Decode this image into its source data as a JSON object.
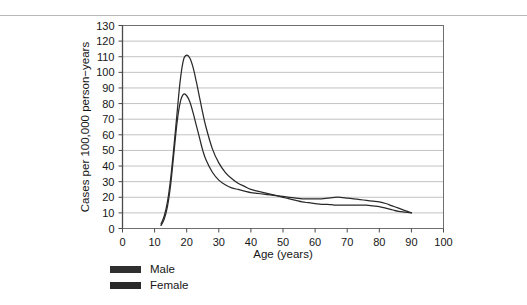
{
  "figure": {
    "background_color": "#ffffff",
    "rule_color": "#b9b9b9"
  },
  "chart_data": {
    "type": "line",
    "title": "",
    "subtitle": "",
    "xlabel": "Age (years)",
    "ylabel": "Cases per 100,000 person−years",
    "xlim": [
      0,
      100
    ],
    "ylim": [
      0,
      130
    ],
    "xticks": [
      0,
      10,
      20,
      30,
      40,
      50,
      60,
      70,
      80,
      90,
      100
    ],
    "yticks": [
      0,
      10,
      20,
      30,
      40,
      50,
      60,
      70,
      80,
      90,
      100,
      110,
      120,
      130
    ],
    "xtick_labels": [
      "0",
      "10",
      "20",
      "30",
      "40",
      "50",
      "60",
      "70",
      "80",
      "90",
      "100"
    ],
    "ytick_labels": [
      "0",
      "10",
      "20",
      "30",
      "40",
      "50",
      "60",
      "70",
      "80",
      "90",
      "100",
      "110",
      "120",
      "130"
    ],
    "grid": "horizontal",
    "grid_color": "#a8a8a8",
    "legend_position": "below-left",
    "series": [
      {
        "name": "Male",
        "color": "#2a2a2a",
        "x": [
          12,
          13,
          14,
          15,
          16,
          17,
          18,
          19,
          20,
          21,
          22,
          23,
          24,
          25,
          26,
          28,
          30,
          32,
          34,
          36,
          38,
          40,
          42,
          44,
          46,
          48,
          50,
          52,
          54,
          56,
          58,
          60,
          62,
          64,
          66,
          68,
          70,
          72,
          74,
          76,
          78,
          80,
          82,
          84,
          86,
          88,
          90
        ],
        "y": [
          3,
          8,
          17,
          32,
          52,
          74,
          95,
          108,
          111,
          109,
          103,
          94,
          84,
          74,
          65,
          51,
          42,
          36,
          32,
          29,
          27,
          25,
          24,
          23,
          22,
          21,
          20,
          19,
          18,
          17,
          16.5,
          16,
          15.5,
          15.5,
          15,
          15,
          15,
          15,
          15,
          15,
          14.5,
          14,
          13,
          12,
          11,
          10.5,
          10
        ]
      },
      {
        "name": "Female",
        "color": "#2a2a2a",
        "x": [
          12,
          13,
          14,
          15,
          16,
          17,
          18,
          19,
          20,
          21,
          22,
          23,
          24,
          25,
          26,
          28,
          30,
          32,
          34,
          36,
          38,
          40,
          42,
          44,
          46,
          48,
          50,
          52,
          54,
          56,
          58,
          60,
          62,
          64,
          66,
          68,
          70,
          72,
          74,
          76,
          78,
          80,
          82,
          84,
          86,
          88,
          90
        ],
        "y": [
          2,
          6,
          14,
          28,
          48,
          68,
          81,
          86,
          85,
          81,
          74,
          66,
          58,
          50,
          44,
          36,
          31,
          28,
          26,
          25,
          24,
          23,
          22.5,
          22,
          21.5,
          21,
          20.5,
          20,
          19.5,
          19,
          19,
          19,
          19,
          19.5,
          20,
          20,
          19.5,
          19,
          18.5,
          18,
          17.5,
          17,
          16,
          14.5,
          13,
          11.5,
          10
        ]
      }
    ],
    "annotations": {
      "male_peak": {
        "age": 20,
        "value": 111
      },
      "female_peak": {
        "age": 19,
        "value": 86
      },
      "crossover_age": 49
    }
  },
  "legend": {
    "items": [
      {
        "label": "Male",
        "color": "#2f2f2f"
      },
      {
        "label": "Female",
        "color": "#2a2a2a"
      }
    ]
  }
}
